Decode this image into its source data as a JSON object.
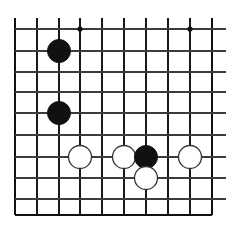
{
  "diagram": {
    "kind": "go-board-corner-diagram",
    "board_background_color": "#ffffff",
    "line_color": "#1a1a1a",
    "edge_line_color": "#111111",
    "inner_line_color": "#3c3c3c",
    "black_stone_color": "#111111",
    "white_stone_fill": "#ffffff",
    "white_stone_outline": "#333333",
    "star_point_color": "#111111",
    "geometry": {
      "width": 228,
      "height": 235,
      "column_x": [
        15,
        37,
        59,
        80,
        102,
        124,
        146,
        168,
        190,
        212
      ],
      "row_y": [
        29,
        51,
        72,
        92,
        113,
        135,
        157,
        178,
        199,
        215
      ],
      "stone_radius": 11.5,
      "star_radius": 2.6,
      "edge_line_width": 2.2,
      "inner_line_width": 1.4
    },
    "star_points": [
      {
        "name": "hoshi-top-left",
        "col": 3,
        "row": 0
      },
      {
        "name": "hoshi-top-right",
        "col": 8,
        "row": 0
      }
    ],
    "stones": [
      {
        "name": "black-stone-1",
        "color": "black",
        "col": 2,
        "row": 1
      },
      {
        "name": "black-stone-2",
        "color": "black",
        "col": 2,
        "row": 4
      },
      {
        "name": "white-stone-1",
        "color": "white",
        "col": 3,
        "row": 6
      },
      {
        "name": "white-stone-2",
        "color": "white",
        "col": 5,
        "row": 6
      },
      {
        "name": "black-stone-3",
        "color": "black",
        "col": 6,
        "row": 6
      },
      {
        "name": "white-stone-3",
        "color": "white",
        "col": 6,
        "row": 7
      },
      {
        "name": "white-stone-4",
        "color": "white",
        "col": 8,
        "row": 6
      }
    ]
  }
}
